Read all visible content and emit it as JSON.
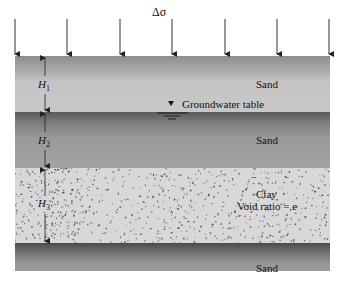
{
  "load": {
    "label": "Δσ",
    "arrow_count": 7
  },
  "layers": [
    {
      "name": "Sand",
      "thickness_label": "H",
      "thickness_sub": "1"
    },
    {
      "name": "Sand",
      "thickness_label": "H",
      "thickness_sub": "2"
    },
    {
      "name": "Clay",
      "subtitle": "Void ratio = e",
      "thickness_label": "H",
      "thickness_sub": "3"
    },
    {
      "name": "Sand"
    }
  ],
  "groundwater": {
    "label": "Groundwater table"
  },
  "colors": {
    "sand_light": "#c8c8c8",
    "sand_mid": "#a3a3a3",
    "clay": "#d8d8d8",
    "sand_dark": "#9b9b9b",
    "ink": "#111111"
  }
}
